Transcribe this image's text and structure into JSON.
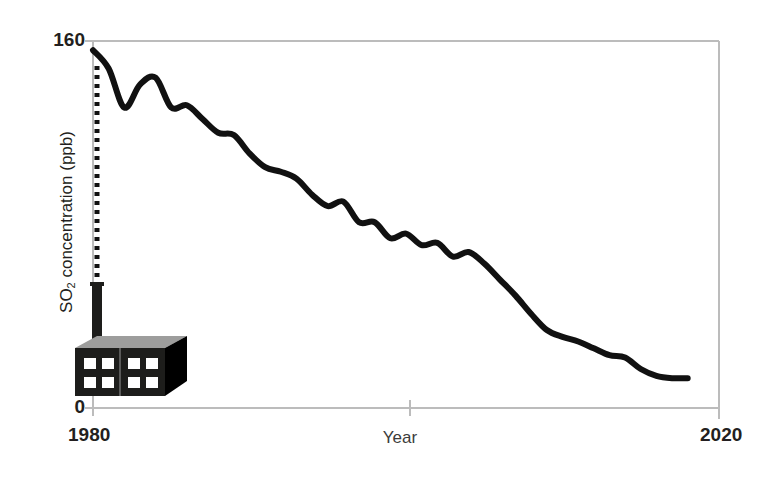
{
  "chart_data": {
    "type": "line",
    "title": "",
    "subtitle": "",
    "xlabel": "Year",
    "ylabel": "SO2 concentration (ppb)",
    "ylabel_rich": {
      "pre": "SO",
      "sub": "2",
      "post": " concentration (ppb)"
    },
    "xlim": [
      1980,
      2020
    ],
    "ylim": [
      0,
      160
    ],
    "x_ticks": [
      1980,
      2000,
      2020
    ],
    "x_tick_labels": [
      "1980",
      "",
      "2020"
    ],
    "y_ticks": [
      0,
      160
    ],
    "y_tick_labels": [
      "0",
      "160"
    ],
    "grid": false,
    "legend": null,
    "legend_position": "none",
    "line_color": "#111111",
    "line_width_px": 6,
    "axis_color": "#b8b8b8",
    "series": [
      {
        "name": "SO2 concentration",
        "x": [
          1980,
          1981,
          1982,
          1983,
          1984,
          1985,
          1986,
          1987,
          1988,
          1989,
          1990,
          1991,
          1992,
          1993,
          1994,
          1995,
          1996,
          1997,
          1998,
          1999,
          2000,
          2001,
          2002,
          2003,
          2004,
          2005,
          2006,
          2007,
          2008,
          2009,
          2010,
          2011,
          2012,
          2013,
          2014,
          2015,
          2016,
          2017,
          2018
        ],
        "values": [
          156,
          148,
          131,
          141,
          144,
          131,
          132,
          126,
          120,
          119,
          111,
          105,
          103,
          100,
          93,
          88,
          90,
          81,
          81,
          74,
          76,
          71,
          72,
          66,
          68,
          63,
          56,
          49,
          41,
          34,
          31,
          29,
          26,
          23,
          22,
          17,
          14,
          13,
          13
        ]
      }
    ],
    "annotations": [
      {
        "type": "dotted-leader",
        "label": "",
        "from": {
          "x": 1980,
          "y": 0
        },
        "to": {
          "x": 1980,
          "y": 156
        },
        "style": "dotted",
        "color": "#111111"
      },
      {
        "type": "illustration",
        "name": "factory-with-smokestack",
        "description": "Black 3D factory building with eight windows and a tall smokestack emitting the dotted plume",
        "colors": {
          "front": "#1d1d1b",
          "side": "#000000",
          "roof": "#9d9d9c",
          "window": "#ffffff",
          "stack": "#1d1d1b"
        }
      }
    ]
  },
  "axes": {
    "y_max_label": "160",
    "y_min_label": "0",
    "x_start_label": "1980",
    "x_end_label": "2020",
    "x_title": "Year"
  }
}
